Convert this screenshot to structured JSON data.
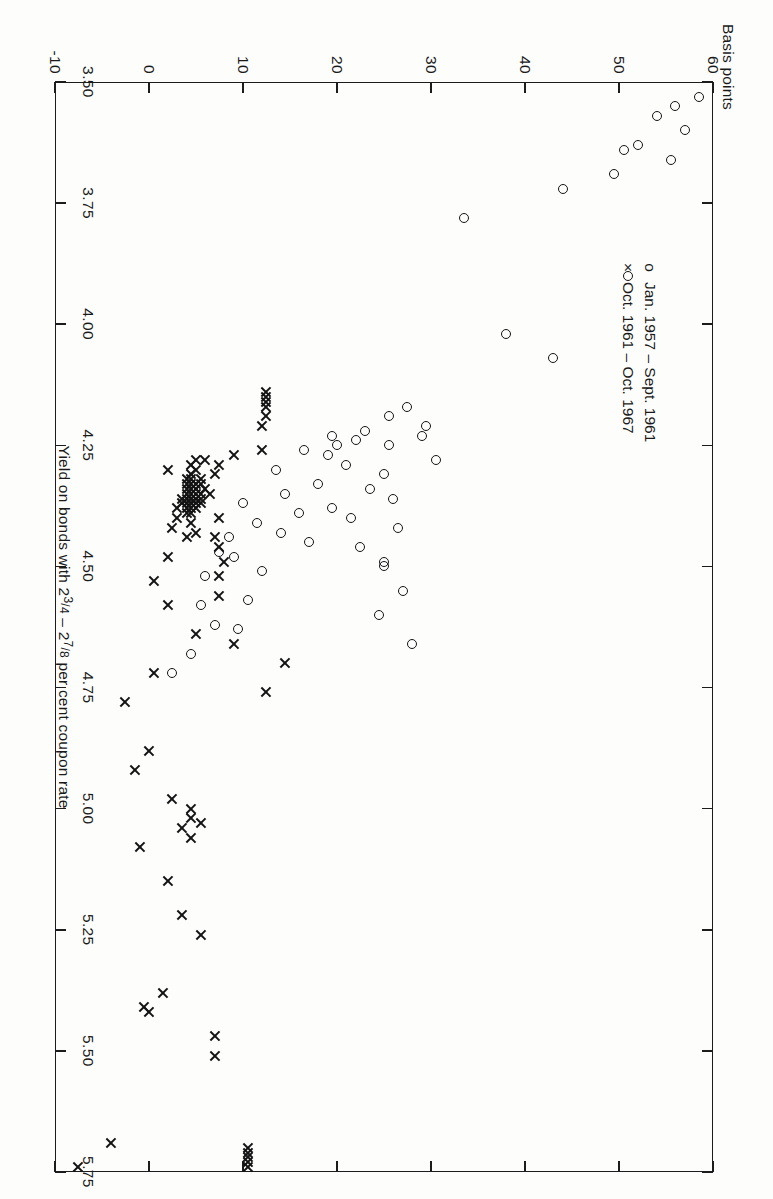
{
  "figure": {
    "y_axis_title": "Basis points",
    "x_axis_title_parts": {
      "pre": "Yield on bonds with 2",
      "f1_num": "3",
      "f1_den": "4",
      "mid": " – 2",
      "f2_num": "7",
      "f2_den": "8",
      "post": " per cent coupon rate"
    },
    "x_axis_title_plain": "Yield on bonds with 2 3/4 – 2 7/8 per cent coupon rate"
  },
  "legend": {
    "position": "inside-upper-left",
    "entries": [
      {
        "glyph": "o",
        "marker": "circle",
        "label": "Jan. 1957 – Sept. 1961"
      },
      {
        "glyph": "×",
        "marker": "cross",
        "label": "Oct. 1961 – Oct. 1967"
      }
    ]
  },
  "chart_data": {
    "type": "scatter",
    "title": "",
    "subtitle": "",
    "xlabel": "Yield on bonds with 2 3/4 – 2 7/8 per cent coupon rate",
    "ylabel": "Basis points",
    "xlim": [
      3.5,
      5.75
    ],
    "ylim": [
      -10,
      60
    ],
    "xticks": [
      3.5,
      4.0,
      4.25,
      4.5,
      4.75,
      5.0,
      5.25,
      5.5,
      5.75
    ],
    "xticklabels": [
      "3.50",
      "4.00",
      "4.25",
      "4.50",
      "4.75",
      "5.00",
      "5.25",
      "5.50",
      "5.75"
    ],
    "xticks_minor": [
      3.75
    ],
    "xticklabels_minor": [
      "3.75"
    ],
    "yticks": [
      60,
      50,
      40,
      30,
      20,
      10,
      0,
      -10
    ],
    "yticklabels": [
      "60",
      "50",
      "40",
      "30",
      "20",
      "10",
      "0",
      "-10"
    ],
    "grid": false,
    "frame": "box",
    "ticks_mirrored": true,
    "legend_position": "upper left inside",
    "series": [
      {
        "name": "Jan. 1957 – Sept. 1961",
        "marker": "o",
        "color": "#141414",
        "points": [
          [
            3.53,
            58.5
          ],
          [
            3.55,
            56.0
          ],
          [
            3.57,
            54.0
          ],
          [
            3.6,
            57.0
          ],
          [
            3.63,
            52.0
          ],
          [
            3.64,
            50.5
          ],
          [
            3.66,
            55.5
          ],
          [
            3.69,
            49.5
          ],
          [
            3.72,
            44.0
          ],
          [
            3.78,
            33.5
          ],
          [
            3.9,
            51.0
          ],
          [
            4.02,
            38.0
          ],
          [
            4.07,
            43.0
          ],
          [
            4.17,
            27.5
          ],
          [
            4.19,
            25.5
          ],
          [
            4.21,
            29.5
          ],
          [
            4.22,
            23.0
          ],
          [
            4.23,
            19.5
          ],
          [
            4.23,
            29.0
          ],
          [
            4.24,
            22.0
          ],
          [
            4.25,
            20.0
          ],
          [
            4.25,
            25.5
          ],
          [
            4.26,
            16.5
          ],
          [
            4.27,
            19.0
          ],
          [
            4.28,
            30.5
          ],
          [
            4.29,
            21.0
          ],
          [
            4.3,
            13.5
          ],
          [
            4.31,
            25.0
          ],
          [
            4.33,
            18.0
          ],
          [
            4.34,
            23.5
          ],
          [
            4.35,
            14.5
          ],
          [
            4.36,
            26.0
          ],
          [
            4.37,
            10.0
          ],
          [
            4.38,
            19.5
          ],
          [
            4.39,
            16.0
          ],
          [
            4.4,
            21.5
          ],
          [
            4.41,
            11.5
          ],
          [
            4.42,
            26.5
          ],
          [
            4.43,
            14.0
          ],
          [
            4.44,
            8.5
          ],
          [
            4.45,
            17.0
          ],
          [
            4.46,
            22.5
          ],
          [
            4.47,
            7.5
          ],
          [
            4.48,
            9.0
          ],
          [
            4.49,
            25.0
          ],
          [
            4.5,
            25.0
          ],
          [
            4.51,
            12.0
          ],
          [
            4.52,
            6.0
          ],
          [
            4.55,
            27.0
          ],
          [
            4.57,
            10.5
          ],
          [
            4.58,
            5.5
          ],
          [
            4.6,
            24.5
          ],
          [
            4.62,
            7.0
          ],
          [
            4.63,
            9.5
          ],
          [
            4.66,
            28.0
          ],
          [
            4.68,
            4.5
          ],
          [
            4.72,
            2.5
          ]
        ]
      },
      {
        "name": "Oct. 1961 – Oct. 1967",
        "marker": "x",
        "color": "#141414",
        "points": [
          [
            4.14,
            12.5
          ],
          [
            4.15,
            12.5
          ],
          [
            4.16,
            12.5
          ],
          [
            4.17,
            12.5
          ],
          [
            4.19,
            12.5
          ],
          [
            4.21,
            12.0
          ],
          [
            4.26,
            12.0
          ],
          [
            4.27,
            9.0
          ],
          [
            4.28,
            6.0
          ],
          [
            4.28,
            5.0
          ],
          [
            4.29,
            4.5
          ],
          [
            4.29,
            7.5
          ],
          [
            4.3,
            2.0
          ],
          [
            4.3,
            5.0
          ],
          [
            4.31,
            4.5
          ],
          [
            4.31,
            7.0
          ],
          [
            4.32,
            5.5
          ],
          [
            4.32,
            4.5
          ],
          [
            4.32,
            4.0
          ],
          [
            4.33,
            5.0
          ],
          [
            4.33,
            4.5
          ],
          [
            4.33,
            4.0
          ],
          [
            4.33,
            5.5
          ],
          [
            4.34,
            4.5
          ],
          [
            4.34,
            5.0
          ],
          [
            4.34,
            6.0
          ],
          [
            4.34,
            4.0
          ],
          [
            4.35,
            4.5
          ],
          [
            4.35,
            5.0
          ],
          [
            4.35,
            5.5
          ],
          [
            4.35,
            4.0
          ],
          [
            4.35,
            6.5
          ],
          [
            4.36,
            4.5
          ],
          [
            4.36,
            5.0
          ],
          [
            4.36,
            3.5
          ],
          [
            4.36,
            5.5
          ],
          [
            4.36,
            4.0
          ],
          [
            4.37,
            4.5
          ],
          [
            4.37,
            5.0
          ],
          [
            4.37,
            4.0
          ],
          [
            4.37,
            3.5
          ],
          [
            4.37,
            5.5
          ],
          [
            4.38,
            4.5
          ],
          [
            4.38,
            4.0
          ],
          [
            4.38,
            5.0
          ],
          [
            4.38,
            3.0
          ],
          [
            4.39,
            4.5
          ],
          [
            4.39,
            4.0
          ],
          [
            4.4,
            3.0
          ],
          [
            4.4,
            7.5
          ],
          [
            4.41,
            4.5
          ],
          [
            4.42,
            2.5
          ],
          [
            4.43,
            5.0
          ],
          [
            4.44,
            7.0
          ],
          [
            4.44,
            4.0
          ],
          [
            4.46,
            7.5
          ],
          [
            4.48,
            2.0
          ],
          [
            4.49,
            8.0
          ],
          [
            4.52,
            7.5
          ],
          [
            4.53,
            0.5
          ],
          [
            4.56,
            7.5
          ],
          [
            4.58,
            2.0
          ],
          [
            4.64,
            5.0
          ],
          [
            4.66,
            9.0
          ],
          [
            4.7,
            14.5
          ],
          [
            4.72,
            0.5
          ],
          [
            4.76,
            12.5
          ],
          [
            4.78,
            -2.5
          ],
          [
            4.88,
            0.0
          ],
          [
            4.92,
            -1.5
          ],
          [
            4.98,
            2.5
          ],
          [
            5.0,
            4.5
          ],
          [
            5.02,
            4.5
          ],
          [
            5.03,
            5.5
          ],
          [
            5.04,
            3.5
          ],
          [
            5.06,
            4.5
          ],
          [
            5.08,
            -1.0
          ],
          [
            5.15,
            2.0
          ],
          [
            5.22,
            3.5
          ],
          [
            5.26,
            5.5
          ],
          [
            5.38,
            1.5
          ],
          [
            5.41,
            -0.5
          ],
          [
            5.42,
            0.0
          ],
          [
            5.47,
            7.0
          ],
          [
            5.51,
            7.0
          ],
          [
            5.7,
            10.5
          ],
          [
            5.71,
            10.5
          ],
          [
            5.72,
            10.5
          ],
          [
            5.73,
            10.5
          ],
          [
            5.74,
            10.5
          ],
          [
            5.69,
            -4.0
          ],
          [
            5.74,
            -7.5
          ]
        ]
      }
    ]
  }
}
